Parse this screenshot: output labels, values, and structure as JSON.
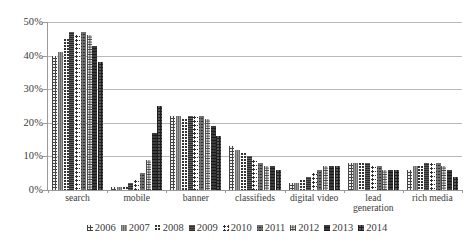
{
  "chart_data": {
    "type": "bar",
    "title": "",
    "subtitle": "",
    "xlabel": "",
    "ylabel": "",
    "ylim": [
      0,
      50
    ],
    "ytick_values": [
      0,
      10,
      20,
      30,
      40,
      50
    ],
    "ytick_labels": [
      "0%",
      "10%",
      "20%",
      "30%",
      "40%",
      "50%"
    ],
    "grid": true,
    "legend_position": "bottom",
    "value_unit": "%",
    "categories": [
      "search",
      "mobile",
      "banner",
      "classifieds",
      "digital video",
      "lead generation",
      "rich media"
    ],
    "category_lines": [
      [
        "search"
      ],
      [
        "mobile"
      ],
      [
        "banner"
      ],
      [
        "classifieds"
      ],
      [
        "digital video"
      ],
      [
        "lead",
        "generation"
      ],
      [
        "rich media"
      ]
    ],
    "series": [
      {
        "name": "2006",
        "values": [
          40,
          1,
          22,
          13,
          2,
          8,
          6
        ]
      },
      {
        "name": "2007",
        "values": [
          41,
          1,
          22,
          12,
          2,
          8,
          7
        ]
      },
      {
        "name": "2008",
        "values": [
          45,
          1,
          21,
          11,
          3,
          8,
          7
        ]
      },
      {
        "name": "2009",
        "values": [
          47,
          2,
          22,
          10,
          4,
          8,
          8
        ]
      },
      {
        "name": "2010",
        "values": [
          46,
          3,
          22,
          9,
          5,
          7,
          8
        ]
      },
      {
        "name": "2011",
        "values": [
          47,
          5,
          22,
          8,
          6,
          7,
          8
        ]
      },
      {
        "name": "2012",
        "values": [
          46,
          9,
          21,
          7,
          7,
          6,
          7
        ]
      },
      {
        "name": "2013",
        "values": [
          43,
          17,
          19,
          7,
          7,
          6,
          6
        ]
      },
      {
        "name": "2014",
        "values": [
          38,
          25,
          16,
          6,
          7,
          6,
          4
        ]
      }
    ]
  }
}
